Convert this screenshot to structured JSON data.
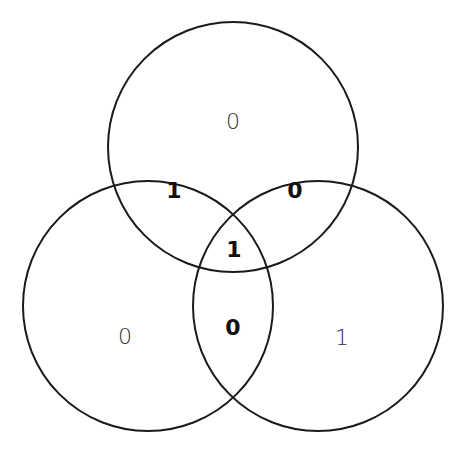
{
  "diagram": {
    "type": "venn-3",
    "stroke_color": "#1a1a1a",
    "background": "#ffffff",
    "circles": [
      {
        "id": "top",
        "cx": 233,
        "cy": 147,
        "r": 125
      },
      {
        "id": "left",
        "cx": 148,
        "cy": 306,
        "r": 125
      },
      {
        "id": "right",
        "cx": 318,
        "cy": 306,
        "r": 125
      }
    ],
    "regions": {
      "top_only": "0",
      "left_only": "0",
      "right_only": "1",
      "top_left": "1",
      "top_right": "0",
      "left_right": "0",
      "all_three": "1"
    }
  }
}
